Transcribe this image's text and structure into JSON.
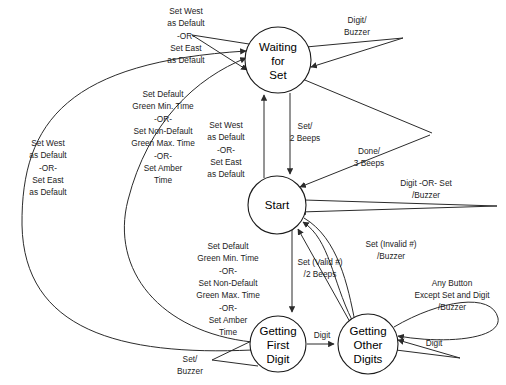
{
  "diagram": {
    "kind": "state-transition-diagram",
    "width": 506,
    "height": 385,
    "background": "#ffffff",
    "line_color": "#2b2b2b",
    "text_color": "#000000"
  },
  "states": [
    {
      "id": "waiting-for-set",
      "name": "Waiting for Set",
      "lines": [
        "Waiting",
        "for",
        "Set"
      ],
      "cx": 278,
      "cy": 60,
      "r": 33
    },
    {
      "id": "start",
      "name": "Start",
      "lines": [
        "Start"
      ],
      "cx": 277,
      "cy": 205,
      "r": 29
    },
    {
      "id": "getting-first-digit",
      "name": "Getting First Digit",
      "lines": [
        "Getting",
        "First",
        "Digit"
      ],
      "cx": 278,
      "cy": 344,
      "r": 28
    },
    {
      "id": "getting-other-digits",
      "name": "Getting Other Digits",
      "lines": [
        "Getting",
        "Other",
        "Digits"
      ],
      "cx": 368,
      "cy": 344,
      "r": 30
    }
  ],
  "transitions": [
    {
      "id": "t-waiting-self-set-default",
      "from": "waiting-for-set",
      "to": "waiting-for-set",
      "lines": [
        "Set West",
        "as Default",
        "-OR-",
        "Set East",
        "as Default"
      ],
      "label_x": 186,
      "label_y": 30
    },
    {
      "id": "t-waiting-self-digit-buzzer",
      "from": "waiting-for-set",
      "to": "waiting-for-set",
      "lines": [
        "Digit/",
        "Buzzer"
      ],
      "label_x": 357,
      "label_y": 27
    },
    {
      "id": "t-start-to-waiting-set-default",
      "from": "start",
      "to": "waiting-for-set",
      "lines": [
        "Set West",
        "as Default",
        "-OR-",
        "Set East",
        "as Default"
      ],
      "label_x": 226,
      "label_y": 149
    },
    {
      "id": "t-waiting-to-start-set-2beeps",
      "from": "waiting-for-set",
      "to": "start",
      "lines": [
        "Set/",
        "2 Beeps"
      ],
      "label_x": 301,
      "label_y": 133
    },
    {
      "id": "t-done-3beeps",
      "from": "getting-other-digits",
      "to": "waiting-for-set",
      "lines": [
        "Done/",
        "3 Beeps"
      ],
      "label_x": 369,
      "label_y": 158
    },
    {
      "id": "t-start-self-digit-or-set",
      "from": "start",
      "to": "start",
      "lines": [
        "Digit -OR-  Set",
        "/Buzzer"
      ],
      "label_x": 426,
      "label_y": 190
    },
    {
      "id": "t-far-left-loop-set-default",
      "from": "getting-first-digit",
      "to": "waiting-for-set",
      "lines": [
        "Set West",
        "as Default",
        "-OR-",
        "Set East",
        "as Default"
      ],
      "label_x": 48,
      "label_y": 167
    },
    {
      "id": "t-start-to-first-digit-green",
      "from": "start",
      "to": "getting-first-digit",
      "lines": [
        "Set Default",
        "Green Min. Time",
        "-OR-",
        "Set Non-Default",
        "Green Max. Time",
        "-OR-",
        "Set Amber",
        "Time"
      ],
      "label_x": 228,
      "label_y": 288
    },
    {
      "id": "t-upper-curve-green",
      "from": "getting-first-digit",
      "to": "waiting-for-set",
      "lines": [
        "Set Default",
        "Green Min. Time",
        "-OR-",
        "Set Non-Default",
        "Green Max. Time",
        "-OR-",
        "Set Amber",
        "Time"
      ],
      "label_x": 163,
      "label_y": 133
    },
    {
      "id": "t-set-valid-2beeps",
      "from": "getting-other-digits",
      "to": "start",
      "lines": [
        "Set (Valid #)",
        "/2 Beeps"
      ],
      "label_x": 320,
      "label_y": 269
    },
    {
      "id": "t-set-invalid-buzzer",
      "from": "getting-other-digits",
      "to": "start",
      "lines": [
        "Set (Invalid #)",
        "/Buzzer"
      ],
      "label_x": 391,
      "label_y": 251
    },
    {
      "id": "t-any-button-buzzer",
      "from": "getting-other-digits",
      "to": "getting-other-digits",
      "lines": [
        "Any Button",
        "Except Set and Digit",
        "/Buzzer"
      ],
      "label_x": 464,
      "label_y": 290
    },
    {
      "id": "t-first-to-other-digit",
      "from": "getting-first-digit",
      "to": "getting-other-digits",
      "lines": [
        "Digit"
      ],
      "label_x": 322,
      "label_y": 338
    },
    {
      "id": "t-first-self-set-buzzer",
      "from": "getting-first-digit",
      "to": "getting-first-digit",
      "lines": [
        "Set/",
        "Buzzer"
      ],
      "label_x": 192,
      "label_y": 366
    },
    {
      "id": "t-other-self-digit",
      "from": "getting-other-digits",
      "to": "getting-other-digits",
      "lines": [
        "Digit"
      ],
      "label_x": 434,
      "label_y": 344
    }
  ]
}
